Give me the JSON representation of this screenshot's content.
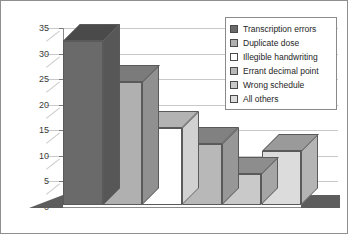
{
  "chart_data": {
    "type": "bar",
    "title": "",
    "xlabel": "",
    "ylabel": "",
    "ylim": [
      0,
      35
    ],
    "grid": true,
    "legend_position": "top-right",
    "style": "3d-column",
    "categories": [
      "Transcription errors",
      "Duplicate dose",
      "Illegible handwriting",
      "Errant decimal point",
      "Wrong schedule",
      "All others"
    ],
    "values": [
      32,
      24,
      15,
      12,
      6,
      10.5
    ],
    "yticks": [
      "0",
      "5",
      "10",
      "15",
      "20",
      "25",
      "30",
      "35"
    ],
    "ytick_values": [
      0,
      5,
      10,
      15,
      20,
      25,
      30,
      35
    ],
    "colors": [
      "#6a6a6a",
      "#b0b0b0",
      "#ffffff",
      "#b8b8b8",
      "#c9c9c9",
      "#dcdcdc"
    ]
  },
  "legend": {
    "items": [
      {
        "label": "Transcription errors",
        "color": "#6a6a6a"
      },
      {
        "label": "Duplicate dose",
        "color": "#b0b0b0"
      },
      {
        "label": "Illegible handwriting",
        "color": "#ffffff"
      },
      {
        "label": "Errant decimal point",
        "color": "#b8b8b8"
      },
      {
        "label": "Wrong schedule",
        "color": "#c9c9c9"
      },
      {
        "label": "All others",
        "color": "#dcdcdc"
      }
    ]
  },
  "axis": {
    "baseline_label": "0",
    "max_label": "35"
  },
  "theme": {
    "frame_border": "#8f8f8f",
    "gridline": "#c9c9c9",
    "axis_line": "#8a8a8a",
    "floor": "#5d5d5d",
    "bar_outline": "#5a5a5a",
    "text": "#1e1e1e"
  }
}
